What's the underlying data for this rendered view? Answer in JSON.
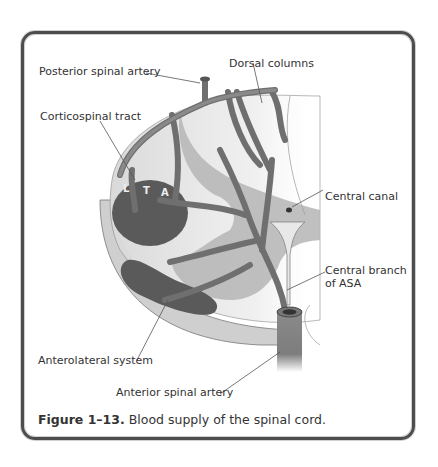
{
  "figure": {
    "labels": {
      "posterior_spinal_artery": "Posterior spinal artery",
      "dorsal_columns": "Dorsal columns",
      "corticospinal_tract": "Corticospinal tract",
      "central_canal": "Central canal",
      "central_branch_line1": "Central branch",
      "central_branch_line2": "of ASA",
      "anterolateral_system": "Anterolateral system",
      "anterior_spinal_artery": "Anterior spinal artery"
    },
    "tract_letters": [
      "L",
      "T",
      "A"
    ],
    "caption": {
      "number": "Figure 1–13.",
      "text": "Blood supply of the spinal cord."
    }
  }
}
